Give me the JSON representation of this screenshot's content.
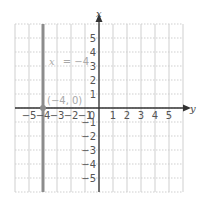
{
  "chart_data": {
    "type": "line",
    "title": "",
    "xlabel": "y",
    "ylabel": "x",
    "horizontal_axis": {
      "label": "y",
      "range": [
        -6,
        6
      ],
      "ticks": [
        -5,
        -4,
        -3,
        -2,
        -1,
        0,
        1,
        2,
        3,
        4,
        5
      ]
    },
    "vertical_axis": {
      "label": "x",
      "range": [
        -6,
        6
      ],
      "ticks": [
        5,
        4,
        3,
        2,
        1,
        -1,
        -2,
        -3,
        -4,
        -5
      ]
    },
    "grid": true,
    "series": [
      {
        "name": "x = -4",
        "kind": "vertical-line",
        "horizontal_value": -4,
        "color": "#8c8c8c"
      }
    ],
    "points": [
      {
        "label": "(−4, 0)",
        "h": -4,
        "v": 0
      }
    ],
    "annotations": [
      {
        "text": "x = −4",
        "h": -1.5,
        "v": 3
      },
      {
        "text": "(−4, 0)",
        "h": -2.5,
        "v": 0.4
      }
    ]
  },
  "labels": {
    "v_axis": "x",
    "h_axis": "y",
    "line_eq_var": "x",
    "line_eq_rest": "= −4",
    "point": "(−4, 0)",
    "origin": "0"
  },
  "colors": {
    "grid": "#cfcfcf",
    "axis": "#333333",
    "line": "#8c8c8c",
    "annotation": "#a9a9a9"
  }
}
